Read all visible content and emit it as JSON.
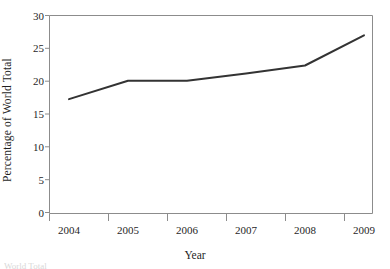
{
  "figure": {
    "ylabel": "Percentage of World Total",
    "xlabel": "Year",
    "caption_fragment": "World Total"
  },
  "style": {
    "line_color": "#333333",
    "axis_color": "#8c8c8c",
    "text_color": "#1f1f1f",
    "background": "#ffffff",
    "line_width": 2
  },
  "chart_data": {
    "type": "line",
    "title": "",
    "xlabel": "Year",
    "ylabel": "Percentage of World Total",
    "x": [
      2004,
      2005,
      2006,
      2007,
      2008,
      2009
    ],
    "values": [
      17.3,
      20.1,
      20.1,
      21.2,
      22.4,
      27.0
    ],
    "xtick_labels": [
      "2004",
      "2005",
      "2006",
      "2007",
      "2008",
      "2009"
    ],
    "ytick_labels": [
      "0",
      "5",
      "10",
      "15",
      "20",
      "25",
      "30"
    ],
    "yticks": [
      0,
      5,
      10,
      15,
      20,
      25,
      30
    ],
    "ylim": [
      0,
      30
    ],
    "xlim": [
      2003.6,
      2009.45
    ],
    "grid": false,
    "legend": null,
    "series": [
      {
        "name": "Percentage of World Total",
        "values": [
          17.3,
          20.1,
          20.1,
          21.2,
          22.4,
          27.0
        ]
      }
    ]
  }
}
